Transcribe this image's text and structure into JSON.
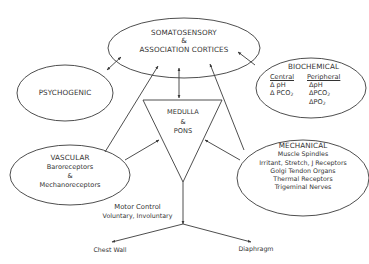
{
  "diagram": {
    "nodes": {
      "cortices": {
        "line1": "SOMATOSENSORY",
        "line2": "&",
        "line3": "ASSOCIATION CORTICES"
      },
      "psychogenic": {
        "label": "PSYCHOGENIC"
      },
      "biochemical": {
        "title": "BIOCHEMICAL",
        "central": {
          "header": "Central",
          "items": [
            "Δ pH",
            "Δ PCO",
            "2"
          ]
        },
        "peripheral": {
          "header": "Peripheral",
          "items": [
            "ΔpH",
            "ΔPCO",
            "2",
            "ΔPO",
            "2"
          ]
        }
      },
      "medulla": {
        "line1": "MEDULLA",
        "line2": "&",
        "line3": "PONS"
      },
      "vascular": {
        "title": "VASCULAR",
        "line1": "Baroreceptors",
        "line2": "&",
        "line3": "Mechanoreceptors"
      },
      "mechanical": {
        "title": "MECHANICAL",
        "items": [
          "Muscle Spindles",
          "Irritant, Stretch, J Receptors",
          "Golgi Tendon Organs",
          "Thermal Receptors",
          "Trigeminal Nerves"
        ]
      },
      "motor_control": {
        "title": "Motor Control",
        "subtitle": "Voluntary, Involuntary"
      },
      "chest_wall": {
        "label": "Chest Wall"
      },
      "diaphragm": {
        "label": "Diaphragm"
      }
    },
    "edges": [
      {
        "from": "psychogenic",
        "to": "cortices",
        "type": "bidirectional"
      },
      {
        "from": "vascular",
        "to": "cortices",
        "type": "arrow"
      },
      {
        "from": "medulla",
        "to": "cortices",
        "type": "bidirectional"
      },
      {
        "from": "biochemical",
        "to": "cortices",
        "type": "arrow"
      },
      {
        "from": "mechanical",
        "to": "cortices",
        "type": "arrow"
      },
      {
        "from": "vascular",
        "to": "medulla",
        "type": "arrow"
      },
      {
        "from": "mechanical",
        "to": "medulla",
        "type": "arrow"
      },
      {
        "from": "medulla",
        "to": "motor_control",
        "type": "arrow"
      },
      {
        "from": "motor_control",
        "to": "chest_wall",
        "type": "arrow"
      },
      {
        "from": "motor_control",
        "to": "diaphragm",
        "type": "arrow"
      }
    ],
    "colors": {
      "stroke": "#3a3a3a",
      "text": "#333333",
      "background": "#ffffff"
    }
  }
}
